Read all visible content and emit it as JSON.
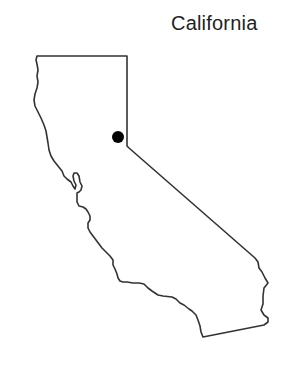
{
  "map": {
    "title": "California",
    "outline_color": "#333333",
    "marker_color": "#000000",
    "background": "#ffffff",
    "marker": {
      "name": "location-marker",
      "cx": 118,
      "cy": 137,
      "r": 6
    }
  }
}
